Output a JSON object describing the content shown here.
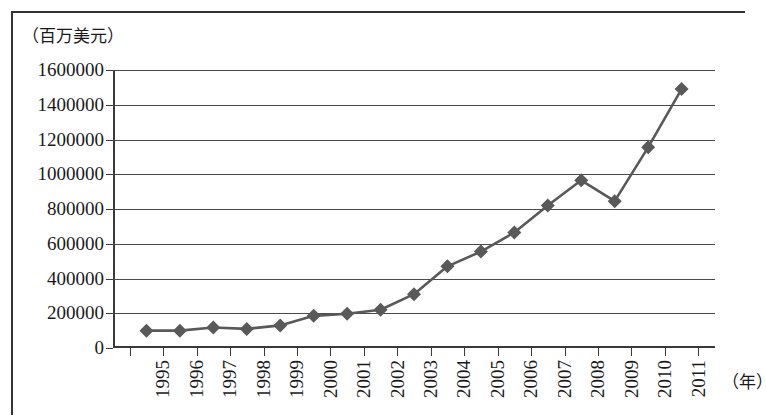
{
  "figure": {
    "unit_label": "（百万美元）",
    "x_axis_name": "（年）"
  },
  "chart_data": {
    "type": "line",
    "title": "",
    "subtitle": "",
    "xlabel": "（年）",
    "ylabel": "（百万美元）",
    "categories": [
      "1995",
      "1996",
      "1997",
      "1998",
      "1999",
      "2000",
      "2001",
      "2002",
      "2003",
      "2004",
      "2005",
      "2006",
      "2007",
      "2008",
      "2009",
      "2010",
      "2011"
    ],
    "values": [
      100000,
      100000,
      118000,
      110000,
      130000,
      185000,
      197000,
      220000,
      310000,
      470000,
      555000,
      665000,
      820000,
      965000,
      845000,
      1155000,
      1490000
    ],
    "series": [
      {
        "name": "",
        "values": [
          100000,
          100000,
          118000,
          110000,
          130000,
          185000,
          197000,
          220000,
          310000,
          470000,
          555000,
          665000,
          820000,
          965000,
          845000,
          1155000,
          1490000
        ],
        "marker": "diamond",
        "color": "#595959"
      }
    ],
    "ylim": [
      0,
      1600000
    ],
    "yticks": [
      0,
      200000,
      400000,
      600000,
      800000,
      1000000,
      1200000,
      1400000,
      1600000
    ],
    "ytick_labels": [
      "0",
      "200000",
      "400000",
      "600000",
      "800000",
      "1000000",
      "1200000",
      "1400000",
      "1600000"
    ],
    "xtick_labels": [
      "1995",
      "1996",
      "1997",
      "1998",
      "1999",
      "2000",
      "2001",
      "2002",
      "2003",
      "2004",
      "2005",
      "2006",
      "2007",
      "2008",
      "2009",
      "2010",
      "2011"
    ],
    "grid": true,
    "grid_axis": "y",
    "legend": false,
    "legend_position": "none",
    "line_color": "#595959",
    "marker_color": "#595959",
    "axis_color": "#3a3a3a",
    "background_color": "#ffffff"
  }
}
